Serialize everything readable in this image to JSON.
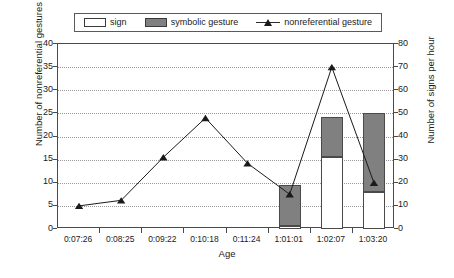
{
  "chart_data": {
    "type": "bar",
    "title": "",
    "xlabel": "Age",
    "ylabel": "Number of nonreferential gestures per hour",
    "y2label": "Number of signs per hour",
    "ylim": [
      0,
      40
    ],
    "y2lim": [
      0,
      80
    ],
    "yticks": [
      "0",
      "5",
      "10",
      "15",
      "20",
      "25",
      "30",
      "35",
      "40"
    ],
    "y2ticks": [
      "0",
      "10",
      "20",
      "30",
      "40",
      "50",
      "60",
      "70",
      "80"
    ],
    "grid": true,
    "legend_position": "top",
    "categories": [
      "0:07:26",
      "0:08:25",
      "0:09:22",
      "0:10:18",
      "0:11:24",
      "1:01:01",
      "1:02:07",
      "1:03:20"
    ],
    "series": [
      {
        "name": "sign",
        "type": "bar-stacked-bottom",
        "axis": "right",
        "color": "#ffffff",
        "values": [
          0,
          0,
          0,
          0,
          0,
          1.5,
          31,
          16
        ]
      },
      {
        "name": "symbolic gesture",
        "type": "bar-stacked-top",
        "axis": "right",
        "color": "#808080",
        "values": [
          0,
          0,
          0,
          0,
          0,
          17.5,
          17.5,
          34
        ]
      },
      {
        "name": "nonreferential gesture",
        "type": "line",
        "axis": "left",
        "color": "#1a1a1a",
        "marker": "triangle",
        "values": [
          5,
          6.2,
          15.5,
          24,
          14.2,
          7.5,
          35,
          10
        ]
      }
    ]
  },
  "legend": {
    "items": [
      {
        "label": "sign",
        "swatch": "white-bar"
      },
      {
        "label": "symbolic gesture",
        "swatch": "gray-bar"
      },
      {
        "label": "nonreferential gesture",
        "swatch": "line-triangle-marker"
      }
    ]
  },
  "colors": {
    "bar_sign": "#ffffff",
    "bar_symbolic": "#808080",
    "line": "#1a1a1a",
    "axis": "#4a4a4a",
    "grid": "#9a9a9a",
    "background": "#ffffff"
  }
}
